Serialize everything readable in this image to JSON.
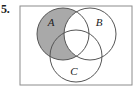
{
  "figure": {
    "exercise_number": "5.",
    "width": 138,
    "height": 90,
    "background_color": "#ffffff"
  },
  "universal_set_box": {
    "name": "universal-set-rectangle",
    "x": 2,
    "y": 2,
    "width": 112,
    "height": 79,
    "stroke_color": "#8c8c8c",
    "fill_color": "#ffffff",
    "stroke_width": 1
  },
  "venn": {
    "shaded_region_description": "A minus B",
    "shade_color": "#a9a9a9",
    "stroke_color": "#555555",
    "unshaded_color": "#ffffff",
    "circles": [
      {
        "label": "A",
        "name": "circle-a",
        "cx": 45,
        "cy": 30,
        "r": 26,
        "shaded": true,
        "label_x": 33,
        "label_y": 22
      },
      {
        "label": "B",
        "name": "circle-b",
        "cx": 72,
        "cy": 30,
        "r": 26,
        "shaded": false,
        "label_x": 81,
        "label_y": 22
      },
      {
        "label": "C",
        "name": "circle-c",
        "cx": 58,
        "cy": 52,
        "r": 26,
        "shaded": false,
        "label_x": 56,
        "label_y": 71
      }
    ]
  }
}
